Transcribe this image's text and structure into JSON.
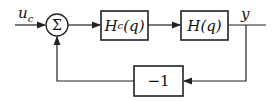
{
  "diagram": {
    "type": "block-diagram",
    "input": {
      "label": "u",
      "subscript": "c"
    },
    "summing_junction": {
      "symbol": "Σ"
    },
    "blocks": [
      {
        "id": "controller",
        "label": "H",
        "subscript": "c",
        "arg": "(q)"
      },
      {
        "id": "plant",
        "label": "H",
        "arg": "(q)"
      },
      {
        "id": "feedback",
        "label": "−1"
      }
    ],
    "output": {
      "label": "y"
    },
    "colors": {
      "stroke": "#222222",
      "background": "#ffffff"
    }
  }
}
